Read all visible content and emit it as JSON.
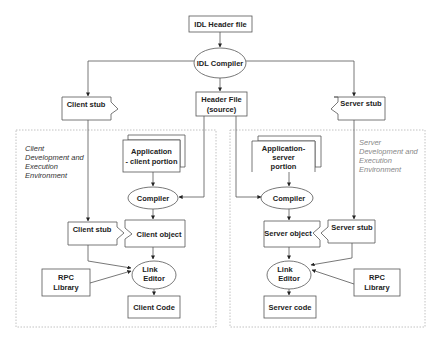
{
  "diagram": {
    "nodes": {
      "idl_header": "IDL Header file",
      "idl_compiler": "IDL Compiler",
      "client_stub_top": "Client stub",
      "header_file": [
        "Header File",
        "(source)"
      ],
      "server_stub_top": "Server stub",
      "client_env": [
        "Client",
        "Development and",
        "Execution",
        "Environment"
      ],
      "server_env": [
        "Server",
        "Development and",
        "Execution",
        "Environment"
      ],
      "app_client": [
        "Application",
        "- client portion"
      ],
      "app_server": [
        "Application-",
        "server",
        "portion"
      ],
      "client_compiler": "Compiler",
      "server_compiler": "Compiler",
      "client_stub_low": "Client stub",
      "client_object": "Client object",
      "server_object": "Server object",
      "server_stub_low": "Server stub",
      "client_link": [
        "Link",
        "Editor"
      ],
      "server_link": [
        "Link",
        "Editor"
      ],
      "client_rpc": [
        "RPC",
        "Library"
      ],
      "server_rpc": [
        "RPC",
        "Library"
      ],
      "client_code": "Client Code",
      "server_code": "Server code"
    },
    "colors": {
      "stroke": "#555555",
      "dashed_border": "#bbbbbb",
      "client_env_text": "#333333",
      "server_env_text": "#888888"
    }
  }
}
